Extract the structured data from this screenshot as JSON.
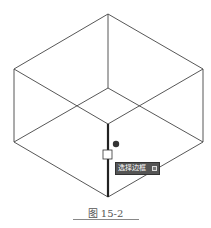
{
  "figure": {
    "caption": "图 15-2",
    "top_partial_text": "⋯ ⋯"
  },
  "tooltip": {
    "label": "选择边框",
    "button_icon": "dropdown-box-icon",
    "background": "#555555"
  },
  "drawing": {
    "type": "isometric-cube-wireframe",
    "line_color": "#444444",
    "selected_edge_color": "#222222",
    "vertices": {
      "top": [
        108,
        14
      ],
      "upper_left": [
        14,
        69
      ],
      "upper_right": [
        203,
        69
      ],
      "inner_center": [
        108,
        88
      ],
      "lower_left": [
        14,
        142
      ],
      "lower_right": [
        203,
        142
      ],
      "front_mid": [
        108,
        124
      ],
      "bottom": [
        108,
        197
      ]
    },
    "grip_square": [
      103,
      150,
      10
    ],
    "cursor_dot": [
      116,
      144
    ]
  }
}
